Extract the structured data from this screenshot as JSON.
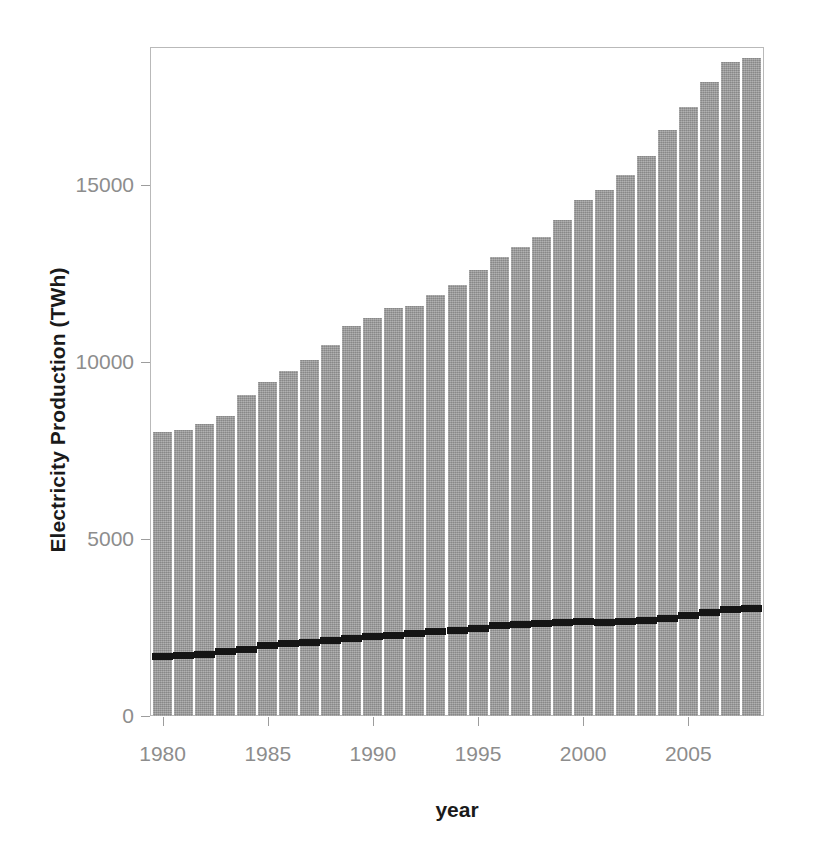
{
  "chart_data": {
    "type": "bar",
    "title": "",
    "xlabel": "year",
    "ylabel": "Electricity Production (TWh)",
    "xlim": [
      1979.4,
      2008.6
    ],
    "ylim": [
      0,
      18600
    ],
    "grid": false,
    "legend": "none",
    "bar_color": "#9b9b9b",
    "overlay_color": "#151515",
    "axis_text_color": "#8d8d8d",
    "label_text_color": "#1a1a1a",
    "x_ticks": [
      1980,
      1985,
      1990,
      1995,
      2000,
      2005
    ],
    "x_tick_labels": [
      "1980",
      "1985",
      "1990",
      "1995",
      "2000",
      "2005"
    ],
    "y_ticks": [
      0,
      5000,
      10000,
      15000
    ],
    "y_tick_labels": [
      "0",
      "5000",
      "10000",
      "15000"
    ],
    "categories": [
      1980,
      1981,
      1982,
      1983,
      1984,
      1985,
      1986,
      1987,
      1988,
      1989,
      1990,
      1991,
      1992,
      1993,
      1994,
      1995,
      1996,
      1997,
      1998,
      1999,
      2000,
      2001,
      2002,
      2003,
      2004,
      2005,
      2006,
      2007,
      2008
    ],
    "series": [
      {
        "name": "Total electricity production",
        "type": "bar",
        "values": [
          8030,
          8090,
          8260,
          8480,
          9060,
          9440,
          9750,
          10050,
          10490,
          11010,
          11240,
          11520,
          11580,
          11880,
          12180,
          12610,
          12970,
          13240,
          13520,
          14010,
          14580,
          14870,
          15290,
          15830,
          16550,
          17190,
          17900,
          18480,
          18600
        ]
      },
      {
        "name": "Fossil-free / secondary overlay segment",
        "type": "segment-overlay",
        "values": [
          1700,
          1710,
          1760,
          1830,
          1900,
          2000,
          2060,
          2080,
          2150,
          2200,
          2250,
          2290,
          2340,
          2400,
          2440,
          2490,
          2560,
          2590,
          2620,
          2650,
          2680,
          2660,
          2680,
          2700,
          2760,
          2860,
          2940,
          3020,
          3060
        ]
      }
    ]
  }
}
